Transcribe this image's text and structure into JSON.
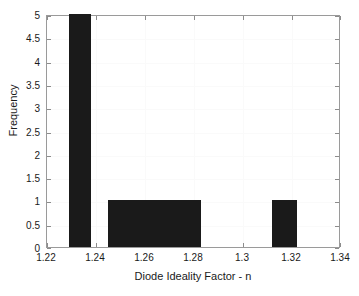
{
  "chart_data": {
    "type": "bar",
    "title": "",
    "xlabel": "Diode Ideality Factor - n",
    "ylabel": "Frequency",
    "xlim": [
      1.22,
      1.34
    ],
    "ylim": [
      0,
      5
    ],
    "grid": true,
    "legend": null,
    "xticks": [
      "1.22",
      "1.24",
      "1.26",
      "1.28",
      "1.3",
      "1.32",
      "1.34"
    ],
    "xtick_values": [
      1.22,
      1.24,
      1.26,
      1.28,
      1.3,
      1.32,
      1.34
    ],
    "yticks": [
      "0",
      "0.5",
      "1",
      "1.5",
      "2",
      "2.5",
      "3",
      "3.5",
      "4",
      "4.5",
      "5"
    ],
    "ytick_values": [
      0,
      0.5,
      1,
      1.5,
      2,
      2.5,
      3,
      3.5,
      4,
      4.5,
      5
    ],
    "bar_color": "#1a1a1a",
    "bins": [
      {
        "label": "1.229-1.238",
        "x_start": 1.229,
        "x_end": 1.238,
        "value": 5
      },
      {
        "label": "1.245-1.283",
        "x_start": 1.245,
        "x_end": 1.283,
        "value": 1
      },
      {
        "label": "1.312-1.322",
        "x_start": 1.312,
        "x_end": 1.322,
        "value": 1
      }
    ],
    "categories": [
      "1.229-1.238",
      "1.245-1.283",
      "1.312-1.322"
    ],
    "values": [
      5,
      1,
      1
    ]
  }
}
